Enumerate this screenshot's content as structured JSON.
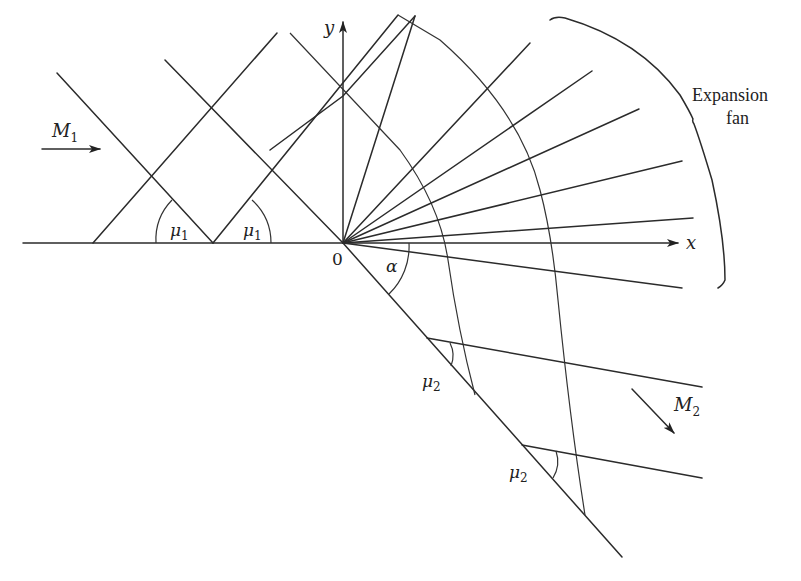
{
  "diagram": {
    "labels": {
      "y_axis": "y",
      "x_axis": "x",
      "origin": "0",
      "upstream_mach": "M",
      "upstream_mach_sub": "1",
      "downstream_mach": "M",
      "downstream_mach_sub": "2",
      "mu1_symbol": "μ",
      "mu1_sub": "1",
      "mu2_symbol": "μ",
      "mu2_sub": "2",
      "turn_angle": "α",
      "fan_label_line1": "Expansion",
      "fan_label_line2": "fan"
    },
    "regions": [
      {
        "name": "upstream",
        "mach": "M1",
        "mach_angle": "μ1",
        "flow_direction": "horizontal, left to right"
      },
      {
        "name": "expansion-fan",
        "description": "centered fan of Mach waves from corner at origin"
      },
      {
        "name": "downstream",
        "mach": "M2",
        "mach_angle": "μ2",
        "flow_direction": "parallel to wall, turned by α"
      }
    ],
    "colors": {
      "line": "#2b2b2b",
      "background": "#ffffff"
    }
  }
}
